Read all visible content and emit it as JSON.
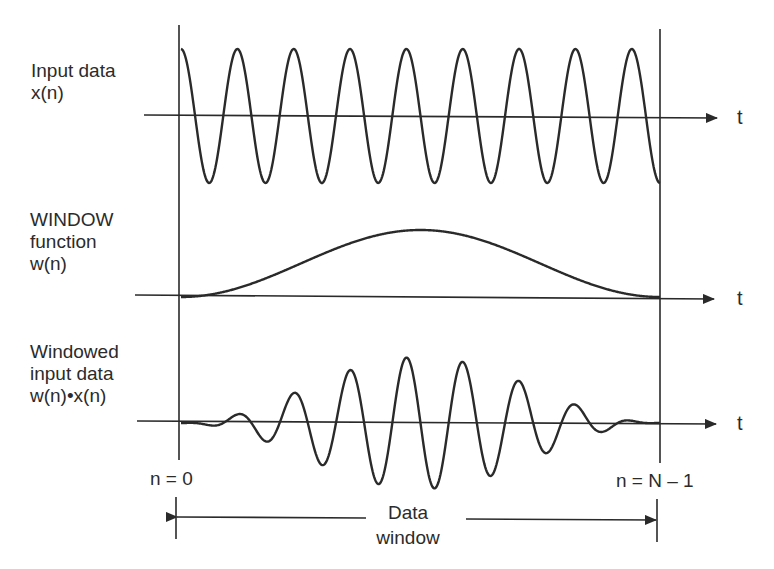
{
  "diagram": {
    "title": "",
    "panels": [
      {
        "id": "input",
        "label_lines": [
          "Input data",
          "x(n)"
        ],
        "axis_label": "t"
      },
      {
        "id": "window",
        "label_lines": [
          "WINDOW",
          "function",
          "w(n)"
        ],
        "axis_label": "t"
      },
      {
        "id": "windowed",
        "label_lines": [
          "Windowed",
          "input data",
          "w(n)•x(n)"
        ],
        "axis_label": "t"
      }
    ],
    "markers": {
      "start": "n = 0",
      "end": "n = N – 1"
    },
    "span_label_lines": [
      "Data",
      "window"
    ],
    "style": {
      "stroke": "#2a2a2a"
    },
    "signal": {
      "x_start": 181,
      "x_end": 660,
      "cycles": 8.5,
      "phase": "cosine",
      "window_type": "hann"
    }
  }
}
